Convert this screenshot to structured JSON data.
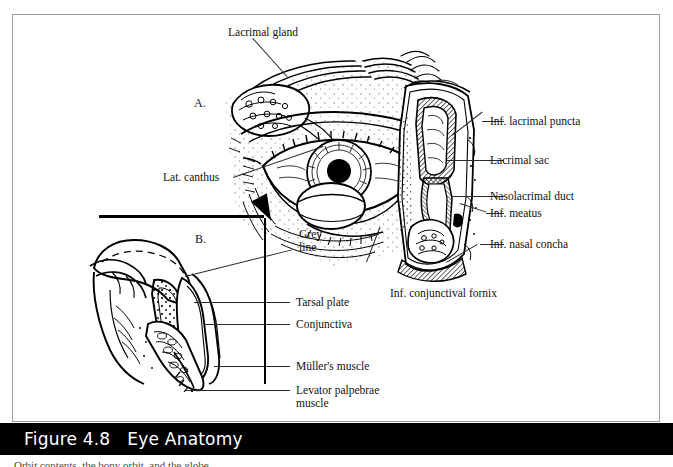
{
  "figure": {
    "caption_number": "Figure 4.8",
    "caption_title": "Eye Anatomy",
    "body_text_cut": "Orbit contents, the bony orbit, and the globe"
  },
  "colors": {
    "ink": "#000000",
    "border": "#9a9a9a",
    "caption_bar_bg": "#000000",
    "caption_text": "#ffffff",
    "leader_line": "#2a2a2a",
    "page_bg": "#ffffff"
  },
  "panels": [
    {
      "id": "A",
      "marker": "A.",
      "description": "Anterior view of the eye with lacrimal apparatus and nasolacrimal duct in coronal section"
    },
    {
      "id": "B",
      "marker": "B.",
      "description": "Sagittal cross-section of the upper eyelid"
    }
  ],
  "labels": {
    "lacrimal_gland": "Lacrimal gland",
    "panel_a": "A.",
    "lat_canthus": "Lat. canthus",
    "inf_lacrimal_puncta": "Inf. lacrimal puncta",
    "lacrimal_sac": "Lacrimal sac",
    "nasolacrimal_duct": "Nasolacrimal duct",
    "inf_meatus": "Inf. meatus",
    "inf_nasal_concha": "Inf. nasal concha",
    "inf_conjunctival_fornix": "Inf. conjunctival fornix",
    "panel_b": "B.",
    "grey_line": "Grey line",
    "tarsal_plate": "Tarsal plate",
    "conjunctiva": "Conjunctiva",
    "mullers_muscle": "Müller's muscle",
    "levator_palpebrae_muscle": "Levator palpebrae muscle"
  }
}
